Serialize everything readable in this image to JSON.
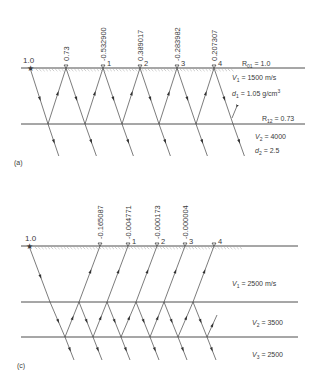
{
  "panel_a": {
    "caption": "(a)",
    "surface_y": 68,
    "interface_y": 124,
    "ray_bottom_y": 156,
    "line_x": [
      21,
      305
    ],
    "source": {
      "x": 30,
      "label": "1.0"
    },
    "receivers": [
      {
        "x": 66,
        "amp": "0.73",
        "num": ""
      },
      {
        "x": 103,
        "amp": "-0.532900",
        "num": "1"
      },
      {
        "x": 140,
        "amp": "0.389017",
        "num": "2"
      },
      {
        "x": 177,
        "amp": "-0.283982",
        "num": "3"
      },
      {
        "x": 214,
        "amp": "0.207307",
        "num": "4"
      }
    ],
    "bounce_x": [
      48,
      85,
      122,
      159,
      196,
      233
    ],
    "labels": {
      "r01": "R01 = 1.0",
      "v1": "V1 = 1500 m/s",
      "d1": "d1 = 1.05 g/cm3",
      "r12": "R12 = 0.73",
      "v2": "V2 = 4000",
      "d2": "d2 = 2.5"
    }
  },
  "panel_c": {
    "caption": "(c)",
    "surface_y": 246,
    "interface1_y": 302,
    "interface2_y": 337,
    "ray_bottom_y": 360,
    "line_x": [
      21,
      298
    ],
    "source": {
      "x": 29,
      "label": "1.0"
    },
    "receivers": [
      {
        "x": 100,
        "amp": "-0.165087",
        "num": ""
      },
      {
        "x": 128,
        "amp": "-0.004771",
        "num": "1"
      },
      {
        "x": 157,
        "amp": "-0.000173",
        "num": "2"
      },
      {
        "x": 185,
        "amp": "-0.000004",
        "num": "3"
      },
      {
        "x": 214,
        "amp": "",
        "num": "4"
      }
    ],
    "labels": {
      "v1": "V1 = 2500 m/s",
      "v2": "V2 = 3500",
      "v3": "V3 = 2500"
    }
  }
}
